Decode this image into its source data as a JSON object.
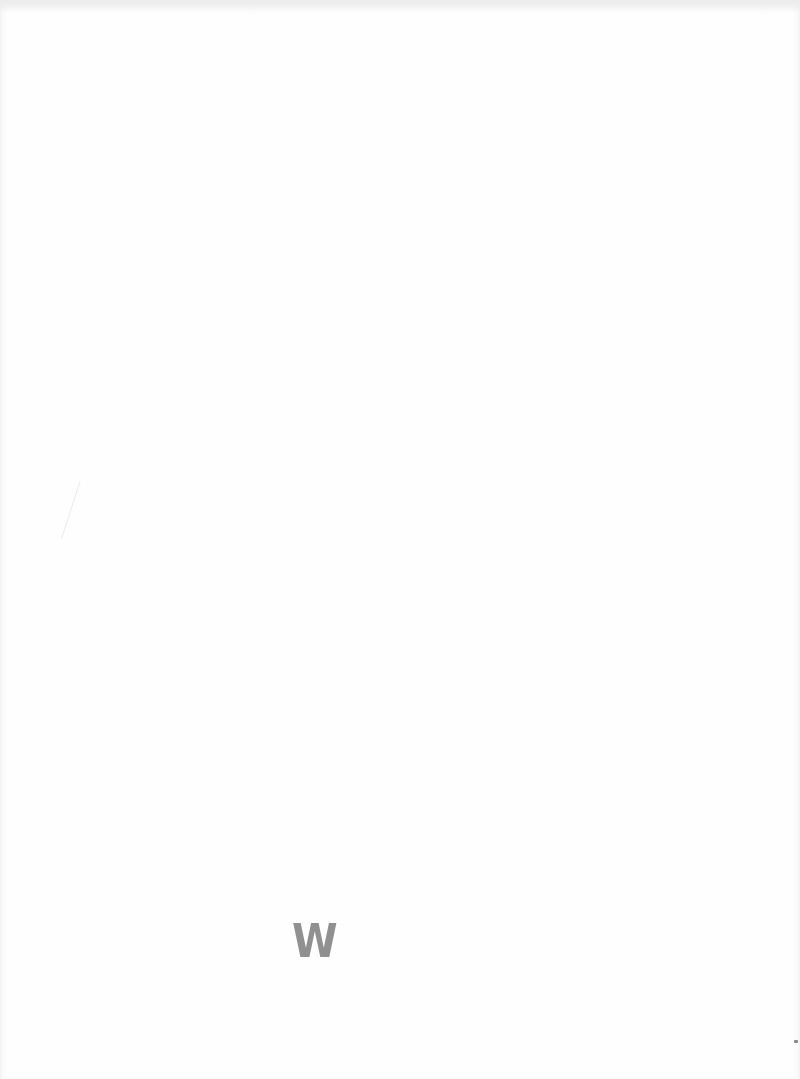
{
  "page": {
    "type": "scanned blank page",
    "background_color": "#fefefe"
  },
  "stamp": {
    "title_legible": "W",
    "title_illegible": "",
    "lines": [
      "",
      "",
      "",
      ""
    ],
    "ink_color": "#3a3a3a",
    "note": "Faded rubber stamp; text largely illegible"
  }
}
